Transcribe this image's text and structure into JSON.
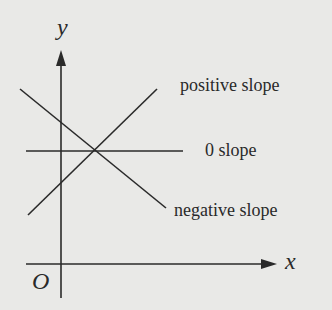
{
  "diagram": {
    "type": "coordinate-plane-slopes",
    "axes": {
      "x_label": "x",
      "y_label": "y",
      "origin_label": "O"
    },
    "lines": [
      {
        "name": "positive",
        "label": "positive slope"
      },
      {
        "name": "zero",
        "label": "0 slope"
      },
      {
        "name": "negative",
        "label": "negative slope"
      }
    ],
    "colors": {
      "background": "#e9e9e7",
      "ink": "#2a2a2a"
    }
  }
}
